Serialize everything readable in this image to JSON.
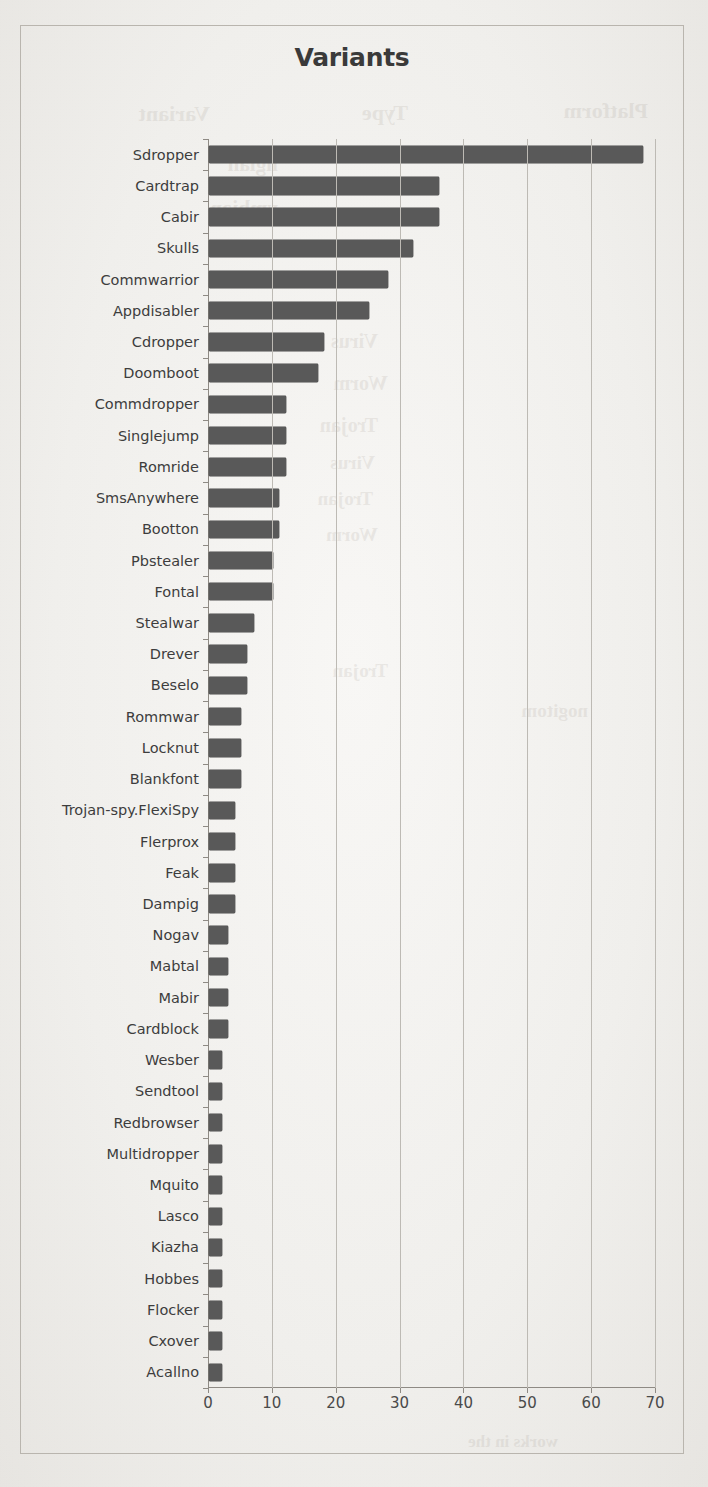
{
  "chart_data": {
    "type": "bar",
    "orientation": "horizontal",
    "title": "Variants",
    "xlabel": "",
    "ylabel": "",
    "xlim": [
      0,
      70
    ],
    "xticks": [
      0,
      10,
      20,
      30,
      40,
      50,
      60,
      70
    ],
    "xtick_labels": [
      "0",
      "10",
      "20",
      "30",
      "40",
      "50",
      "60",
      "70"
    ],
    "grid": "vertical",
    "legend": "none",
    "bar_color": "#595959",
    "categories": [
      "Sdropper",
      "Cardtrap",
      "Cabir",
      "Skulls",
      "Commwarrior",
      "Appdisabler",
      "Cdropper",
      "Doomboot",
      "Commdropper",
      "Singlejump",
      "Romride",
      "SmsAnywhere",
      "Bootton",
      "Pbstealer",
      "Fontal",
      "Stealwar",
      "Drever",
      "Beselo",
      "Rommwar",
      "Locknut",
      "Blankfont",
      "Trojan-spy.FlexiSpy",
      "Flerprox",
      "Feak",
      "Dampig",
      "Nogav",
      "Mabtal",
      "Mabir",
      "Cardblock",
      "Wesber",
      "Sendtool",
      "Redbrowser",
      "Multidropper",
      "Mquito",
      "Lasco",
      "Kiazha",
      "Hobbes",
      "Flocker",
      "Cxover",
      "Acallno"
    ],
    "values": [
      68,
      36,
      36,
      32,
      28,
      25,
      18,
      17,
      12,
      12,
      12,
      11,
      11,
      10,
      10,
      7,
      6,
      6,
      5,
      5,
      5,
      4,
      4,
      4,
      4,
      3,
      3,
      3,
      3,
      2,
      2,
      2,
      2,
      2,
      2,
      2,
      2,
      2,
      2,
      2
    ]
  },
  "background_bleed": [
    {
      "text": "Variant",
      "x": 498,
      "y": 101,
      "size": 22
    },
    {
      "text": "Type",
      "x": 300,
      "y": 100,
      "size": 22
    },
    {
      "text": "Platform",
      "x": 60,
      "y": 98,
      "size": 22
    },
    {
      "text": "ngian",
      "x": 430,
      "y": 152,
      "size": 21
    },
    {
      "text": "ymbian",
      "x": 430,
      "y": 196,
      "size": 21
    },
    {
      "text": "Virus",
      "x": 330,
      "y": 330,
      "size": 20
    },
    {
      "text": "Worm",
      "x": 320,
      "y": 372,
      "size": 20
    },
    {
      "text": "Trojan",
      "x": 330,
      "y": 414,
      "size": 20
    },
    {
      "text": "Virus",
      "x": 333,
      "y": 452,
      "size": 19
    },
    {
      "text": "Trojan",
      "x": 335,
      "y": 488,
      "size": 19
    },
    {
      "text": "Worm",
      "x": 330,
      "y": 524,
      "size": 19
    },
    {
      "text": "Trojan",
      "x": 320,
      "y": 660,
      "size": 19
    },
    {
      "text": "nogitom",
      "x": 120,
      "y": 700,
      "size": 19
    },
    {
      "text": "works in the",
      "x": 150,
      "y": 1432,
      "size": 17
    }
  ]
}
